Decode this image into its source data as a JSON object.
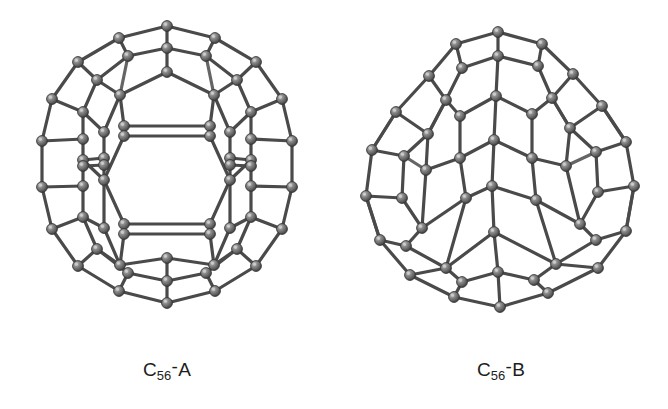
{
  "figure": {
    "kind": "molecular-structure-figure",
    "background_color": "#ffffff",
    "panel_count": 2,
    "atom_color": "#6e6e6e",
    "atom_edge_color": "#3a3a3a",
    "atom_highlight_color": "#b9b9b9",
    "bond_color": "#4a4a4a"
  },
  "panels": [
    {
      "id": "panel-a",
      "caption_element": "C",
      "caption_subscript": "56",
      "caption_dash": "-",
      "caption_isomer": "A",
      "caption_full": "C56-A",
      "description": "C56 fullerene isomer A ball-and-stick cage, symmetric view with central hexagon"
    },
    {
      "id": "panel-b",
      "caption_element": "C",
      "caption_subscript": "56",
      "caption_dash": "-",
      "caption_isomer": "B",
      "caption_full": "C56-B",
      "description": "C56 fullerene isomer B ball-and-stick cage, egg-shaped asymmetric view"
    }
  ]
}
